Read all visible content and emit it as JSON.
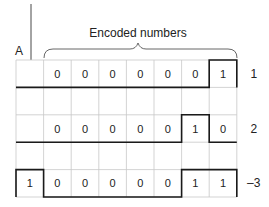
{
  "diagram": {
    "pointer_label": "A",
    "brace_label": "Encoded numbers",
    "rows": [
      {
        "cells": [
          "",
          "0",
          "0",
          "0",
          "0",
          "0",
          "0",
          "1"
        ],
        "value": "1",
        "highlight": [
          7
        ]
      },
      {
        "cells": [
          "",
          "",
          "",
          "",
          "",
          "",
          "",
          ""
        ],
        "value": "",
        "highlight": []
      },
      {
        "cells": [
          "",
          "0",
          "0",
          "0",
          "0",
          "0",
          "1",
          "0"
        ],
        "value": "2",
        "highlight": [
          6
        ]
      },
      {
        "cells": [
          "",
          "",
          "",
          "",
          "",
          "",
          "",
          ""
        ],
        "value": "",
        "highlight": []
      },
      {
        "cells": [
          "1",
          "0",
          "0",
          "0",
          "0",
          "0",
          "1",
          "1"
        ],
        "value": "–3",
        "highlight": [
          0,
          6,
          7
        ]
      }
    ]
  }
}
